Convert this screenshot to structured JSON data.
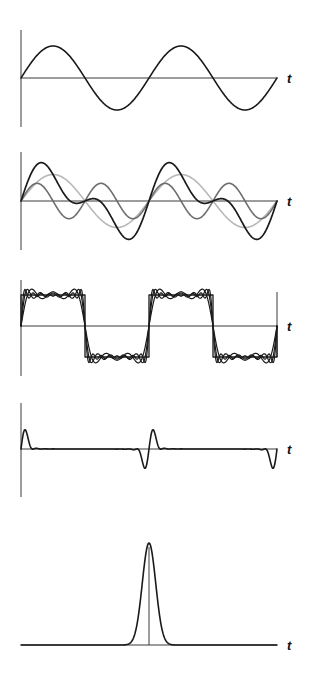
{
  "figure": {
    "axis_label": "t",
    "colors": {
      "axis": "#3a3a3a",
      "primary_curve": "#1a1a1a",
      "secondary_curve": "#6e6e6e",
      "light_curve": "#b8b8b8"
    }
  },
  "chart_data": [
    {
      "type": "line",
      "panel": 1,
      "title": "",
      "xlabel": "t",
      "ylabel": "",
      "grid": false,
      "series": [
        {
          "name": "sin(t)",
          "function": "sin",
          "periods": 2,
          "amplitude": 1,
          "color": "#1a1a1a"
        }
      ]
    },
    {
      "type": "line",
      "panel": 2,
      "title": "",
      "xlabel": "t",
      "ylabel": "",
      "grid": false,
      "series": [
        {
          "name": "fundamental",
          "function": "sin(t)",
          "amplitude": 0.8,
          "color": "#b8b8b8"
        },
        {
          "name": "second harmonic",
          "function": "sin(2t)",
          "amplitude": 0.5,
          "color": "#6e6e6e"
        },
        {
          "name": "sum",
          "function": "0.8 sin(t) + 0.5 sin(2t)",
          "color": "#1a1a1a"
        }
      ]
    },
    {
      "type": "line",
      "panel": 3,
      "title": "",
      "xlabel": "t",
      "ylabel": "",
      "grid": false,
      "series": [
        {
          "name": "square wave",
          "periods": 2,
          "amplitude": 1,
          "color": "#1a1a1a"
        },
        {
          "name": "partial sum (3 terms)",
          "harmonics": [
            1,
            3,
            5
          ],
          "color": "#1a1a1a"
        },
        {
          "name": "partial sum (5 terms)",
          "harmonics": [
            1,
            3,
            5,
            7,
            9
          ],
          "color": "#1a1a1a"
        },
        {
          "name": "partial sum (8 terms)",
          "harmonics": [
            1,
            3,
            5,
            7,
            9,
            11,
            13,
            15
          ],
          "color": "#1a1a1a"
        }
      ]
    },
    {
      "type": "line",
      "panel": 4,
      "title": "",
      "xlabel": "t",
      "ylabel": "",
      "grid": false,
      "series": [
        {
          "name": "sawtooth-edge spike train (Gibbs ripple)",
          "periods": 2,
          "color": "#1a1a1a"
        }
      ]
    },
    {
      "type": "line",
      "panel": 5,
      "title": "",
      "xlabel": "t",
      "ylabel": "",
      "grid": false,
      "series": [
        {
          "name": "gaussian pulse",
          "center": 0.5,
          "peak": 1,
          "color": "#1a1a1a"
        }
      ]
    }
  ],
  "panels": [
    {
      "id": "p1",
      "baseline_y": 78,
      "axis_top": 30,
      "axis_bottom": 127,
      "t_label": "t"
    },
    {
      "id": "p2",
      "baseline_y": 201,
      "axis_top": 152,
      "axis_bottom": 250,
      "t_label": "t"
    },
    {
      "id": "p3",
      "baseline_y": 326,
      "axis_top": 280,
      "axis_bottom": 376,
      "t_label": "t"
    },
    {
      "id": "p4",
      "baseline_y": 449,
      "axis_top": 403,
      "axis_bottom": 497,
      "t_label": "t"
    },
    {
      "id": "p5",
      "baseline_y": 645,
      "axis_top": null,
      "axis_bottom": null,
      "t_label": "t"
    }
  ]
}
